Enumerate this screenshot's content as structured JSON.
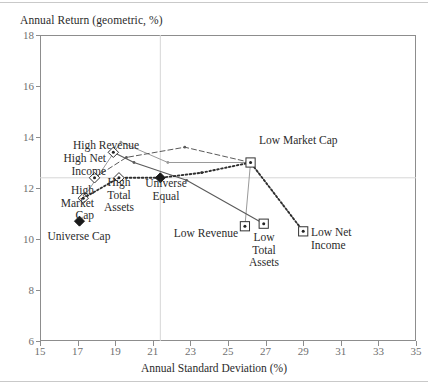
{
  "chart_data": {
    "type": "scatter",
    "title": "",
    "ylabel": "Annual Return (geometric, %)",
    "xlabel": "Annual Standard Deviation (%)",
    "xlim": [
      15,
      35
    ],
    "ylim": [
      6,
      18
    ],
    "xticks": [
      15,
      17,
      19,
      21,
      23,
      25,
      27,
      29,
      31,
      33,
      35
    ],
    "yticks": [
      6,
      8,
      10,
      12,
      14,
      16,
      18
    ],
    "grid": "reference lines at x=21.4 and y=12.4 (Universe Equal)",
    "legend": "none (points labelled in-place)",
    "points": [
      {
        "label": "High Revenue",
        "x": 18.9,
        "y": 13.4,
        "marker": "open-diamond-dot"
      },
      {
        "label": "High Net Income",
        "x": 17.9,
        "y": 12.4,
        "marker": "open-diamond-dot"
      },
      {
        "label": "High Market Cap",
        "x": 17.3,
        "y": 11.6,
        "marker": "open-diamond-dot"
      },
      {
        "label": "High Total Assets",
        "x": 19.2,
        "y": 12.4,
        "marker": "open-diamond-dot"
      },
      {
        "label": "Universe Cap",
        "x": 17.1,
        "y": 10.7,
        "marker": "filled-diamond"
      },
      {
        "label": "Universe Equal",
        "x": 21.4,
        "y": 12.4,
        "marker": "filled-diamond"
      },
      {
        "label": "Low Market Cap",
        "x": 26.2,
        "y": 13.0,
        "marker": "open-square-dot"
      },
      {
        "label": "Low Revenue",
        "x": 25.9,
        "y": 10.5,
        "marker": "open-square-dot"
      },
      {
        "label": "Low Total Assets",
        "x": 26.9,
        "y": 10.6,
        "marker": "open-square-dot"
      },
      {
        "label": "Low Net Income",
        "x": 29.0,
        "y": 10.3,
        "marker": "open-square-dot"
      }
    ],
    "series": [
      {
        "name": "Market Cap",
        "style": "solid-grey",
        "points": [
          [
            17.3,
            11.6
          ],
          [
            19.3,
            13.8
          ],
          [
            21.8,
            13.0
          ],
          [
            26.2,
            13.0
          ],
          [
            25.9,
            10.5
          ]
        ]
      },
      {
        "name": "Revenue",
        "style": "solid-dark",
        "points": [
          [
            18.9,
            13.4
          ],
          [
            20.0,
            13.0
          ],
          [
            22.8,
            12.3
          ],
          [
            26.9,
            10.6
          ]
        ]
      },
      {
        "name": "Net Income",
        "style": "dashed",
        "points": [
          [
            17.9,
            12.4
          ],
          [
            19.6,
            13.2
          ],
          [
            22.7,
            13.6
          ],
          [
            26.2,
            13.0
          ],
          [
            29.0,
            10.3
          ]
        ]
      },
      {
        "name": "Total Assets",
        "style": "dotted",
        "points": [
          [
            17.3,
            11.6
          ],
          [
            19.2,
            12.4
          ],
          [
            21.4,
            12.4
          ],
          [
            23.6,
            12.6
          ],
          [
            26.2,
            13.0
          ],
          [
            29.0,
            10.3
          ]
        ]
      }
    ],
    "labels": {
      "high_revenue": "High Revenue",
      "high_net_income": "High Net\nIncome",
      "high_market_cap": "High\nMarket\nCap",
      "high_total_assets": "High\nTotal\nAssets",
      "universe_cap": "Universe Cap",
      "universe_equal": "Universe\nEqual",
      "low_market_cap": "Low Market Cap",
      "low_revenue": "Low Revenue",
      "low_total_assets": "Low\nTotal\nAssets",
      "low_net_income": "Low Net\nIncome"
    }
  },
  "colors": {
    "frame": "#8d8d8d",
    "tick_text": "#6f6f6f",
    "label_text": "#2b2b2b",
    "line_grey": "#9a9a9a",
    "line_dark": "#5a5a5a",
    "gridline": "#d6d6d6",
    "background": "#ffffff"
  }
}
